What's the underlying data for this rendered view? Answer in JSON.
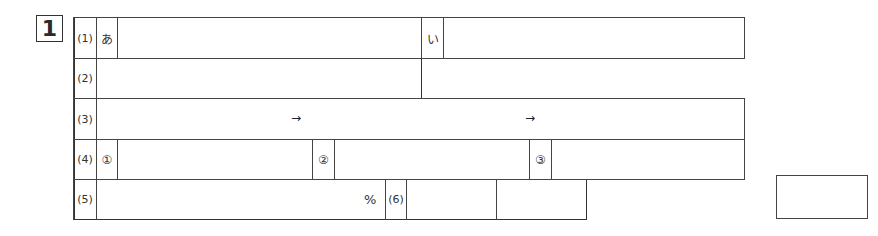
{
  "question_number": "1",
  "rows": [
    {
      "label": "(1)",
      "subs": [
        "あ",
        "い"
      ]
    },
    {
      "label": "(2)"
    },
    {
      "label": "(3)",
      "arrows": [
        "→",
        "→"
      ]
    },
    {
      "label": "(4)",
      "subs": [
        "①",
        "②",
        "③"
      ]
    },
    {
      "label": "(5)",
      "unit": "%"
    },
    {
      "label": "(6)"
    }
  ],
  "answers": {
    "q1_a": "",
    "q1_i": "",
    "q2": "",
    "q3_1": "",
    "q3_2": "",
    "q3_3": "",
    "q4_1": "",
    "q4_2": "",
    "q4_3": "",
    "q5": "",
    "q6_1": "",
    "q6_2": ""
  },
  "score": ""
}
